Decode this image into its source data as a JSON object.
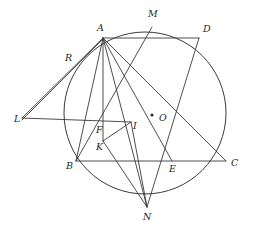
{
  "figure": {
    "background_color": "#ffffff",
    "stroke_color": "#3a3a3a",
    "label_color": "#1f1f1f",
    "width": 253,
    "height": 229
  },
  "circle": {
    "name": "main-circle",
    "center_label": "O",
    "cx": 145,
    "cy": 113,
    "r": 81
  },
  "points": [
    {
      "id": "A",
      "label": "A",
      "x": 103,
      "y": 38,
      "label_x": 97,
      "label_y": 31,
      "on_circle": true,
      "dot": false
    },
    {
      "id": "M",
      "label": "M",
      "x": 152,
      "y": 27,
      "label_x": 148,
      "label_y": 17,
      "on_circle": true,
      "dot": false
    },
    {
      "id": "D",
      "label": "D",
      "x": 199,
      "y": 38,
      "label_x": 203,
      "label_y": 32,
      "on_circle": true,
      "dot": false
    },
    {
      "id": "R",
      "label": "R",
      "x": 74,
      "y": 62,
      "label_x": 65,
      "label_y": 61,
      "on_circle": true,
      "dot": false
    },
    {
      "id": "L",
      "label": "L",
      "x": 22,
      "y": 118,
      "label_x": 14,
      "label_y": 122,
      "on_circle": false,
      "dot": false
    },
    {
      "id": "F",
      "label": "F",
      "x": 103,
      "y": 122,
      "label_x": 96,
      "label_y": 133,
      "on_circle": false,
      "dot": false
    },
    {
      "id": "I",
      "label": "I",
      "x": 131,
      "y": 122,
      "label_x": 133,
      "label_y": 129,
      "on_circle": false,
      "dot": false
    },
    {
      "id": "O",
      "label": "O",
      "x": 155,
      "y": 117,
      "label_x": 159,
      "label_y": 121,
      "on_circle": false,
      "dot": true
    },
    {
      "id": "K",
      "label": "K",
      "x": 103,
      "y": 141,
      "label_x": 96,
      "label_y": 150,
      "on_circle": false,
      "dot": false
    },
    {
      "id": "B",
      "label": "B",
      "x": 76,
      "y": 161,
      "label_x": 66,
      "label_y": 169,
      "on_circle": true,
      "dot": false
    },
    {
      "id": "E",
      "label": "E",
      "x": 172,
      "y": 161,
      "label_x": 169,
      "label_y": 172,
      "on_circle": false,
      "dot": false
    },
    {
      "id": "C",
      "label": "C",
      "x": 226,
      "y": 161,
      "label_x": 231,
      "label_y": 166,
      "on_circle": true,
      "dot": false
    },
    {
      "id": "N",
      "label": "N",
      "x": 147,
      "y": 207,
      "label_x": 143,
      "label_y": 220,
      "on_circle": true,
      "dot": false
    }
  ],
  "segments": [
    {
      "name": "segment-A-D",
      "from": "A",
      "to": "D"
    },
    {
      "name": "segment-B-C",
      "from": "B",
      "to": "C"
    },
    {
      "name": "segment-L-I",
      "from": "L",
      "to": "I"
    },
    {
      "name": "segment-L-A",
      "from": "L",
      "to": "A"
    },
    {
      "name": "segment-L-R-A",
      "from": "L",
      "to": "A"
    },
    {
      "name": "segment-A-B",
      "from": "A",
      "to": "B"
    },
    {
      "name": "segment-A-K",
      "from": "A",
      "to": "K"
    },
    {
      "name": "segment-A-N",
      "from": "A",
      "to": "N"
    },
    {
      "name": "segment-A-E",
      "from": "A",
      "to": "E"
    },
    {
      "name": "segment-A-C",
      "from": "A",
      "to": "C"
    },
    {
      "name": "segment-M-B",
      "from": "M",
      "to": "B"
    },
    {
      "name": "segment-D-N",
      "from": "D",
      "to": "N"
    },
    {
      "name": "segment-K-N",
      "from": "K",
      "to": "N"
    },
    {
      "name": "segment-I-N",
      "from": "I",
      "to": "N"
    },
    {
      "name": "segment-F-K",
      "from": "F",
      "to": "K"
    },
    {
      "name": "segment-K-I",
      "from": "K",
      "to": "I"
    }
  ]
}
